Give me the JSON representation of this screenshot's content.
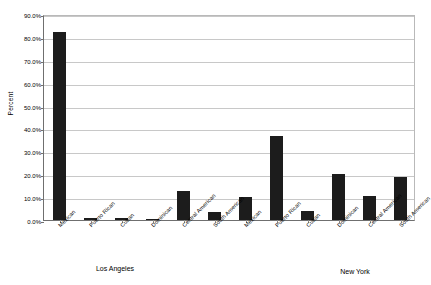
{
  "chart_data": {
    "type": "bar",
    "title": "",
    "xlabel": "",
    "ylabel": "Percent",
    "ylim": [
      0,
      90
    ],
    "grid": true,
    "legend": "none",
    "y_ticks": [
      "0.0%",
      "10.0%",
      "20.0%",
      "30.0%",
      "40.0%",
      "50.0%",
      "60.0%",
      "70.0%",
      "80.0%",
      "90.0%"
    ],
    "y_tick_values": [
      0,
      10,
      20,
      30,
      40,
      50,
      60,
      70,
      80,
      90
    ],
    "groups": [
      {
        "name": "Los Angeles",
        "categories": [
          "Mexican",
          "Puerto Rican",
          "Cuban",
          "Dominican",
          "Central American",
          "South American"
        ],
        "values": [
          82.0,
          1.0,
          1.0,
          0.2,
          12.5,
          3.5
        ]
      },
      {
        "name": "New York",
        "categories": [
          "Mexican",
          "Puerto Rican",
          "Cuban",
          "Dominican",
          "Central American",
          "South American"
        ],
        "values": [
          10.0,
          36.5,
          4.0,
          20.0,
          10.5,
          19.0
        ]
      }
    ],
    "bar_color": "#1c1c1c",
    "gridline_color": "#c8c8c8",
    "axis_color": "#6f6f6f"
  }
}
